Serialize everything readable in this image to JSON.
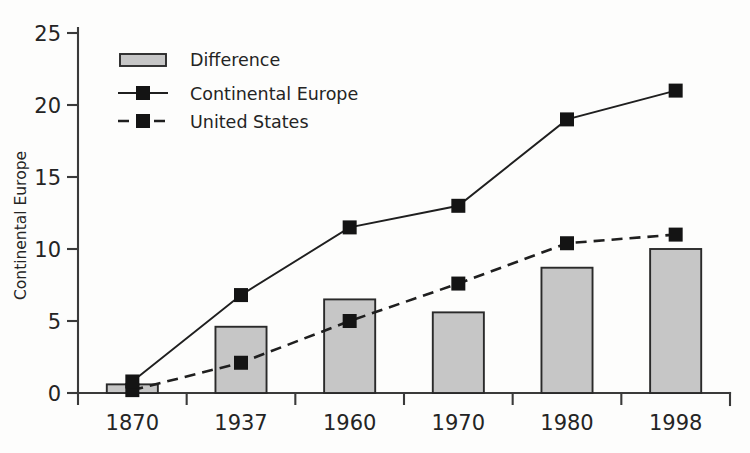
{
  "chart_data": {
    "type": "bar",
    "title": "",
    "xlabel": "",
    "ylabel": "Continental Europe",
    "categories": [
      "1870",
      "1937",
      "1960",
      "1970",
      "1980",
      "1998"
    ],
    "ylim": [
      0,
      25
    ],
    "yticks": [
      0,
      5,
      10,
      15,
      20,
      25
    ],
    "grid": false,
    "legend_position": "upper-left-inside",
    "series": [
      {
        "name": "Difference",
        "kind": "bar",
        "values": [
          0.6,
          4.6,
          6.5,
          5.6,
          8.7,
          10.0
        ]
      },
      {
        "name": "Continental Europe",
        "kind": "line-solid-square",
        "values": [
          0.8,
          6.8,
          11.5,
          13.0,
          19.0,
          21.0
        ]
      },
      {
        "name": "United States",
        "kind": "line-dashed-square",
        "values": [
          0.2,
          2.1,
          5.0,
          7.6,
          10.4,
          11.0
        ]
      }
    ]
  },
  "axes": {
    "y_tick_labels": [
      "0",
      "5",
      "10",
      "15",
      "20",
      "25"
    ],
    "x_tick_labels": [
      "1870",
      "1937",
      "1960",
      "1970",
      "1980",
      "1998"
    ],
    "y_axis_title": "Continental Europe"
  },
  "legend": {
    "items": [
      {
        "label": "Difference",
        "marker": "bar-swatch"
      },
      {
        "label": "Continental Europe",
        "marker": "solid-line-square"
      },
      {
        "label": "United States",
        "marker": "dashed-line-square"
      }
    ]
  },
  "colors": {
    "bar_fill": "#c6c6c6",
    "bar_stroke": "#2a2a2a",
    "line": "#1f1f1f",
    "axis": "#3a3a3a",
    "text": "#242424",
    "background": "#fdfdfc"
  }
}
